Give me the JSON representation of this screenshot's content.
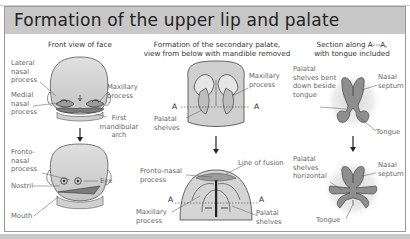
{
  "title": "Formation of the upper lip and palate",
  "columns": [
    {
      "heading": "Front view of face",
      "top_labels": [
        "Lateral nasal process",
        "Medial nasal process",
        "Maxillary process",
        "First mandibular arch"
      ],
      "bottom_labels": [
        "Fronto-nasal process",
        "Nostril",
        "Mouth",
        "Eye"
      ]
    },
    {
      "heading_line1": "Formation of the secondary palate,",
      "heading_line2": "view from below with mandible removed",
      "top_labels": [
        "Maxillary process",
        "Palatal shelves"
      ],
      "bottom_labels": [
        "Fronto-nasal process",
        "Line of fusion",
        "Maxillary process",
        "Palatal shelves"
      ],
      "section_marker": "A"
    },
    {
      "heading_line1": "Section along A---A,",
      "heading_line2": "with tongue included",
      "top_labels": [
        "Palatal shelves bent down beside tongue",
        "Nasal septum",
        "Tongue"
      ],
      "bottom_labels": [
        "Palatal shelves horizontal",
        "Nasal septum",
        "Tongue"
      ]
    }
  ],
  "colors": {
    "title_bar": "#c8c8c8",
    "tissue": "#c9c9c9",
    "tissue_dark": "#8a8a8a",
    "label": "#666666"
  }
}
